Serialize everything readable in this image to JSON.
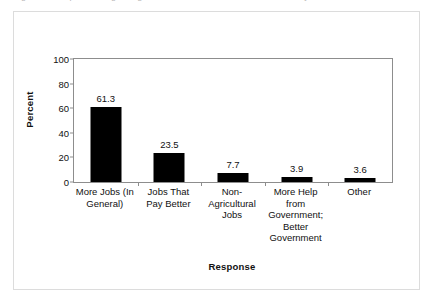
{
  "figure": {
    "caption_sliver": "Figure 3. Responses regarding what is most needed for the community.",
    "background_color": "#ffffff",
    "frame_color": "#dcdcdc",
    "axis_color": "#8d8d8d",
    "bar_color": "#000000"
  },
  "chart_data": {
    "type": "bar",
    "title": "",
    "xlabel": "Response",
    "ylabel": "Percent",
    "ylim": [
      0,
      100
    ],
    "yticks": [
      0,
      20,
      40,
      60,
      80,
      100
    ],
    "ytick_labels": [
      "0",
      "20",
      "40",
      "60",
      "80",
      "100"
    ],
    "grid": false,
    "legend": false,
    "legend_position": "none",
    "categories": [
      "More Jobs (In General)",
      "Jobs That Pay Better",
      "Non-Agricultural Jobs",
      "More Help from Government; Better Government",
      "Other"
    ],
    "category_label_lines": [
      [
        "More Jobs (In",
        "General)"
      ],
      [
        "Jobs That",
        "Pay Better"
      ],
      [
        "Non-",
        "Agricultural",
        "Jobs"
      ],
      [
        "More Help",
        "from",
        "Government;",
        "Better",
        "Government"
      ],
      [
        "Other"
      ]
    ],
    "values": [
      61.3,
      23.5,
      7.7,
      3.9,
      3.6
    ],
    "value_labels": [
      "61.3",
      "23.5",
      "7.7",
      "3.9",
      "3.6"
    ]
  }
}
